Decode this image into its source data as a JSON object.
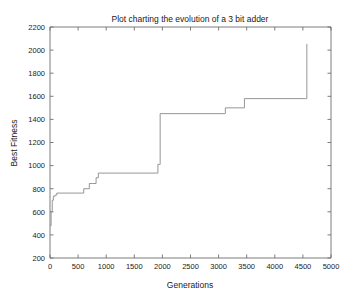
{
  "chart_data": {
    "type": "line",
    "title": "Plot charting the evolution of a 3 bit adder",
    "xlabel": "Generations",
    "ylabel": "Best Fitness",
    "xlim": [
      0,
      5000
    ],
    "ylim": [
      200,
      2200
    ],
    "xticks": [
      0,
      500,
      1000,
      1500,
      2000,
      2500,
      3000,
      3500,
      4000,
      4500,
      5000
    ],
    "yticks": [
      200,
      400,
      600,
      800,
      1000,
      1200,
      1400,
      1600,
      1800,
      2000,
      2200
    ],
    "xtick_labels": [
      "0",
      "500",
      "1000",
      "1500",
      "2000",
      "2500",
      "3000",
      "3500",
      "4000",
      "4500",
      "5000"
    ],
    "ytick_labels": [
      "200",
      "400",
      "600",
      "800",
      "1000",
      "1200",
      "1400",
      "1600",
      "1800",
      "2000",
      "2200"
    ],
    "grid": false,
    "legend": null,
    "series": [
      {
        "name": "Best Fitness",
        "line_color": "#8a8a8a",
        "step": "post",
        "x": [
          0,
          20,
          40,
          60,
          90,
          120,
          560,
          600,
          660,
          700,
          760,
          820,
          860,
          1900,
          1920,
          1950,
          1960,
          3100,
          3120,
          3440,
          3460,
          4550,
          4570,
          4580
        ],
        "y": [
          480,
          600,
          700,
          735,
          745,
          762,
          762,
          800,
          800,
          845,
          845,
          895,
          935,
          935,
          1010,
          1010,
          1450,
          1450,
          1500,
          1500,
          1580,
          1580,
          2050,
          2050
        ]
      }
    ],
    "annotations": []
  },
  "figure": {
    "background_color": "#ffffff",
    "axes_color": "#6e6e6e",
    "text_color": "#1a1a1a"
  }
}
